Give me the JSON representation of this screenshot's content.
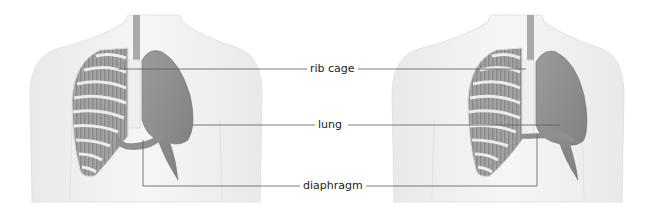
{
  "diagram": {
    "type": "anatomical comparison",
    "figures": [
      {
        "name": "left-torso",
        "state": "diaphragm relaxed (domed)"
      },
      {
        "name": "right-torso",
        "state": "diaphragm contracted (flattened)"
      }
    ],
    "labels": [
      {
        "id": "rib-cage",
        "text": "rib cage"
      },
      {
        "id": "lung",
        "text": "lung"
      },
      {
        "id": "diaphragm",
        "text": "diaphragm"
      }
    ],
    "colors": {
      "background": "#ffffff",
      "body": "#f0f0f0",
      "body_outline": "#e0e0e0",
      "lung": "#8c8c8c",
      "ribs": "#e6e6e6",
      "rib_gaps": "#9a9a9a",
      "trachea": "#a8a8a8",
      "leader_line": "#555555"
    }
  }
}
